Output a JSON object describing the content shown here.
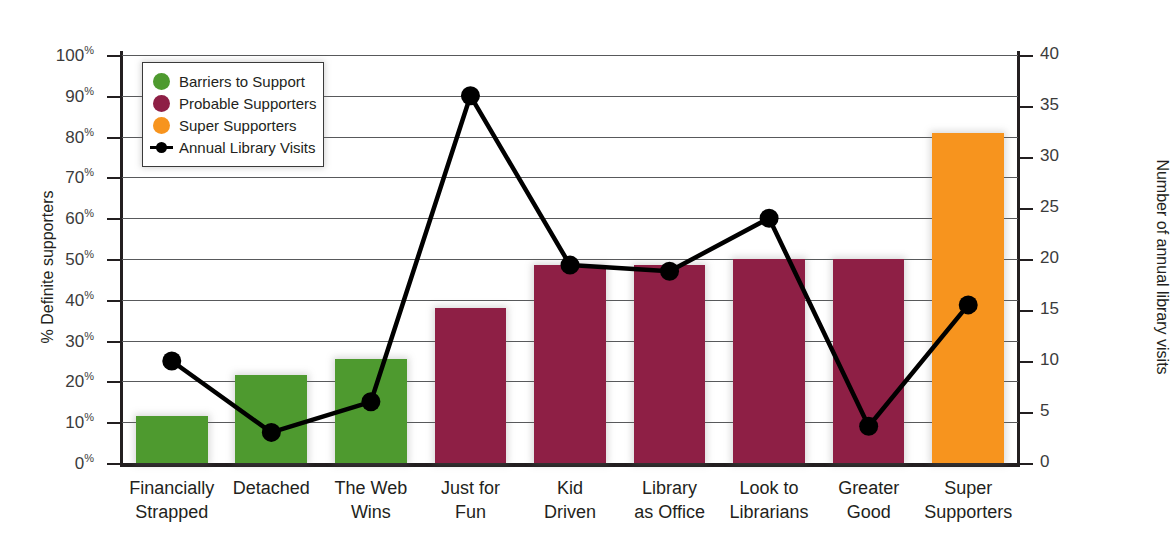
{
  "chart_data": {
    "type": "bar",
    "title": "",
    "xlabel": "",
    "ylabel": "% Definite supporters",
    "y2label": "Number of annual library visits",
    "ylim": [
      0,
      100
    ],
    "y2lim": [
      0,
      40
    ],
    "grid": true,
    "legend_position": "top-left",
    "categories": [
      "Financially\nStrapped",
      "Detached",
      "The Web\nWins",
      "Just for\nFun",
      "Kid\nDriven",
      "Library\nas Office",
      "Look to\nLibrarians",
      "Greater\nGood",
      "Super\nSupporters"
    ],
    "category_lines": [
      [
        "Financially",
        "Strapped"
      ],
      [
        "Detached",
        ""
      ],
      [
        "The Web",
        "Wins"
      ],
      [
        "Just for",
        "Fun"
      ],
      [
        "Kid",
        "Driven"
      ],
      [
        "Library",
        "as Office"
      ],
      [
        "Look to",
        "Librarians"
      ],
      [
        "Greater",
        "Good"
      ],
      [
        "Super",
        "Supporters"
      ]
    ],
    "series": [
      {
        "name": "% Definite supporters (bars)",
        "axis": "left",
        "unit": "%",
        "values": [
          11.5,
          21.5,
          25.5,
          38,
          48.5,
          48.5,
          50,
          50,
          81
        ],
        "colors": [
          "#4e9a2f",
          "#4e9a2f",
          "#4e9a2f",
          "#8e1f45",
          "#8e1f45",
          "#8e1f45",
          "#8e1f45",
          "#8e1f45",
          "#f7941e"
        ],
        "group_names": [
          "Barriers to Support",
          "Barriers to Support",
          "Barriers to Support",
          "Probable Supporters",
          "Probable Supporters",
          "Probable Supporters",
          "Probable Supporters",
          "Probable Supporters",
          "Super Supporters"
        ]
      },
      {
        "name": "Annual Library Visits",
        "axis": "right",
        "type": "line",
        "color": "#000000",
        "values": [
          10,
          3,
          6,
          36,
          19.4,
          18.8,
          24,
          3.6,
          15.5
        ]
      }
    ],
    "y_ticks_left": [
      "0%",
      "10%",
      "20%",
      "30%",
      "40%",
      "50%",
      "60%",
      "70%",
      "80%",
      "90%",
      "100%"
    ],
    "y_ticks_left_values": [
      0,
      10,
      20,
      30,
      40,
      50,
      60,
      70,
      80,
      90,
      100
    ],
    "y_ticks_right": [
      "0",
      "5",
      "10",
      "15",
      "20",
      "25",
      "30",
      "35",
      "40"
    ],
    "y_ticks_right_values": [
      0,
      5,
      10,
      15,
      20,
      25,
      30,
      35,
      40
    ]
  },
  "axes": {
    "left_title": "% Definite supporters",
    "right_title": "Number of annual library visits"
  },
  "legend": {
    "items": [
      {
        "label": "Barriers to Support",
        "color": "#4e9a2f",
        "marker": "circle-swatch"
      },
      {
        "label": "Probable Supporters",
        "color": "#8e1f45",
        "marker": "circle-swatch"
      },
      {
        "label": "Super Supporters",
        "color": "#f7941e",
        "marker": "circle-swatch"
      },
      {
        "label": "Annual Library Visits",
        "color": "#000000",
        "marker": "line-dot"
      }
    ]
  },
  "colors": {
    "green": "#4e9a2f",
    "maroon": "#8e1f45",
    "orange": "#f7941e",
    "line": "#000000",
    "grid": "#58595b",
    "axis": "#231f20"
  }
}
